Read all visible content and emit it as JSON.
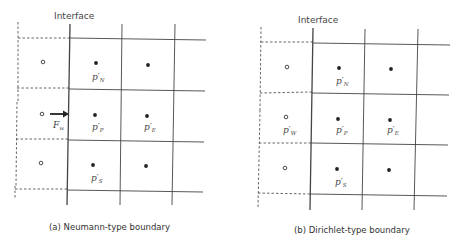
{
  "panels": [
    {
      "id": "a",
      "interface_label": "Interface",
      "caption": "(a) Neumann-type boundary",
      "labels": {
        "north": {
          "base": "p′",
          "sub": "N"
        },
        "center": {
          "base": "p′",
          "sub": "P"
        },
        "east": {
          "base": "p′",
          "sub": "E"
        },
        "south": {
          "base": "p′",
          "sub": "S"
        },
        "flux": {
          "base": "F",
          "sub": "w"
        }
      }
    },
    {
      "id": "b",
      "interface_label": "Interface",
      "caption": "(b) Dirichlet-type boundary",
      "labels": {
        "north": {
          "base": "p′",
          "sub": "N"
        },
        "center": {
          "base": "p′",
          "sub": "P"
        },
        "east": {
          "base": "p′",
          "sub": "E"
        },
        "south": {
          "base": "p′",
          "sub": "S"
        },
        "west": {
          "base": "p′",
          "sub": "W"
        }
      }
    }
  ],
  "colors": {
    "line": "#444444",
    "dashed": "#555555",
    "node": "#222222"
  }
}
